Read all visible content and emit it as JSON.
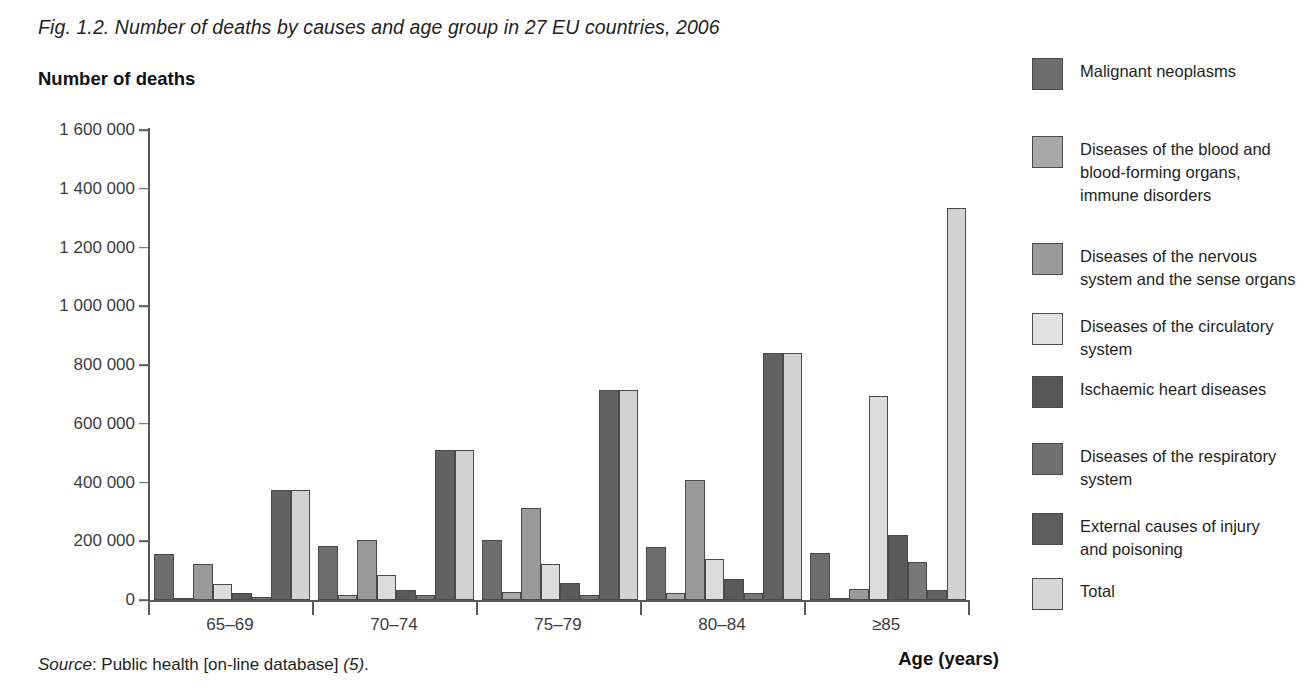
{
  "figure": {
    "title": "Fig. 1.2. Number of deaths by causes and age group in 27 EU countries, 2006",
    "y_axis_title": "Number of deaths",
    "x_axis_title": "Age (years)",
    "source_prefix": "Source",
    "source_text": ": Public health [on-line database] ",
    "source_ref": "(5)",
    "source_end": "."
  },
  "chart_data": {
    "type": "bar",
    "title": "Fig. 1.2. Number of deaths by causes and age group in 27 EU countries, 2006",
    "xlabel": "Age (years)",
    "ylabel": "Number of deaths",
    "ylim": [
      0,
      1600000
    ],
    "ytick_step": 200000,
    "grid": false,
    "legend_position": "right",
    "categories": [
      "65–69",
      "70–74",
      "75–79",
      "80–84",
      "≥85"
    ],
    "ytick_labels": [
      "0",
      "200 000",
      "400 000",
      "600 000",
      "800 000",
      "1 000 000",
      "1 200 000",
      "1 400 000",
      "1 600 000"
    ],
    "series": [
      {
        "name": "Malignant neoplasms",
        "color": "#6d6d6d",
        "values": [
          155000,
          183000,
          203000,
          181000,
          160000
        ]
      },
      {
        "name": "Diseases of the blood and\nblood-forming organs,\nimmune disorders",
        "color": "#a8a8a8",
        "values": [
          8000,
          17000,
          28000,
          24000,
          6000
        ]
      },
      {
        "name": "Diseases of the nervous\nsystem and the sense organs",
        "color": "#9a9a9a",
        "values": [
          123000,
          204000,
          313000,
          410000,
          36000
        ]
      },
      {
        "name": "Diseases of the circulatory\nsystem",
        "color": "#dcdcdc",
        "values": [
          53000,
          85000,
          122000,
          140000,
          693000
        ]
      },
      {
        "name": "Ischaemic heart diseases",
        "color": "#5a5a5a",
        "values": [
          25000,
          34000,
          57000,
          73000,
          221000
        ]
      },
      {
        "name": "Diseases of the respiratory\nsystem",
        "color": "#777777",
        "values": [
          10000,
          16000,
          17000,
          24000,
          131000
        ]
      },
      {
        "name": "External causes of injury\nand poisoning",
        "color": "#626262",
        "values": [
          375000,
          510000,
          715000,
          842000,
          33000
        ]
      },
      {
        "name": "Total",
        "color": "#d2d2d2",
        "values": [
          375000,
          510000,
          715000,
          842000,
          1335000
        ]
      }
    ]
  },
  "legend": [
    {
      "label": "Malignant neoplasms",
      "color": "#6d6d6d"
    },
    {
      "label": "Diseases of the blood and\nblood-forming organs,\nimmune disorders",
      "color": "#a8a8a8"
    },
    {
      "label": "Diseases of the nervous\nsystem and the sense organs",
      "color": "#9a9a9a"
    },
    {
      "label": "Diseases of the circulatory\nsystem",
      "color": "#e2e2e2"
    },
    {
      "label": "Ischaemic heart diseases",
      "color": "#575757"
    },
    {
      "label": "Diseases of the respiratory\nsystem",
      "color": "#707070"
    },
    {
      "label": "External causes of injury\nand poisoning",
      "color": "#5e5e5e"
    },
    {
      "label": "Total",
      "color": "#d6d6d6"
    }
  ]
}
